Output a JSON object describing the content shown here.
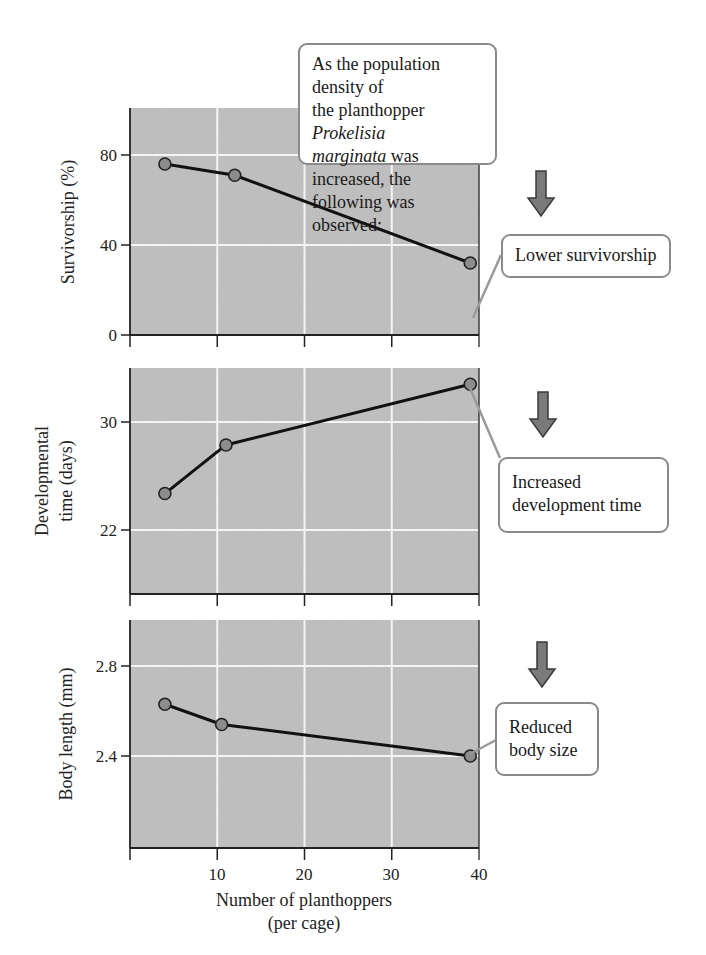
{
  "intro_callout": {
    "line1": "As the population density of",
    "line2_pre": "the planthopper ",
    "line2_italic": "Prokelisia",
    "line3_italic": "marginata",
    "line3_post": " was increased, the",
    "line4": "following was observed:"
  },
  "callouts": [
    {
      "lines": [
        "Lower survivorship"
      ]
    },
    {
      "lines": [
        "Increased",
        "development time"
      ]
    },
    {
      "lines": [
        "Reduced",
        "body size"
      ]
    }
  ],
  "icons": {
    "arrow": "down-arrow-icon"
  },
  "colors": {
    "plot_bg": "#c2c2c2",
    "grid": "#f4f4f4",
    "line": "#111111",
    "marker_fill": "#8c8c8c",
    "callout_border": "#8a8a8a",
    "arrow_fill": "#7a7a7a"
  },
  "x_axis": {
    "title_line1": "Number of planthoppers",
    "title_line2": "(per cage)",
    "ticks": [
      "10",
      "20",
      "30",
      "40"
    ]
  },
  "chart_data": [
    {
      "type": "line",
      "title": "",
      "xlabel": "Number of planthoppers (per cage)",
      "ylabel": "Survivorship (%)",
      "x": [
        4,
        12,
        39
      ],
      "values": [
        76,
        71,
        32
      ],
      "xlim": [
        0,
        40
      ],
      "ylim": [
        0,
        100
      ],
      "yticks": [
        "0",
        "40",
        "80"
      ],
      "grid": true,
      "annotation": "Lower survivorship"
    },
    {
      "type": "line",
      "title": "",
      "xlabel": "Number of planthoppers (per cage)",
      "ylabel": "Developmental time (days)",
      "ylabel_lines": [
        "Developmental",
        "time (days)"
      ],
      "x": [
        4,
        11,
        39
      ],
      "values": [
        24.7,
        28.3,
        32.8
      ],
      "xlim": [
        0,
        40
      ],
      "ylim": [
        16.5,
        34
      ],
      "yticks": [
        "22",
        "30"
      ],
      "grid": true,
      "annotation": "Increased development time"
    },
    {
      "type": "line",
      "title": "",
      "xlabel": "Number of planthoppers (per cage)",
      "ylabel": "Body length (mm)",
      "x": [
        4,
        10.5,
        39
      ],
      "values": [
        2.63,
        2.54,
        2.4
      ],
      "xlim": [
        0,
        40
      ],
      "ylim": [
        2.0,
        2.99
      ],
      "yticks": [
        "2.4",
        "2.8"
      ],
      "grid": true,
      "annotation": "Reduced body size"
    }
  ]
}
